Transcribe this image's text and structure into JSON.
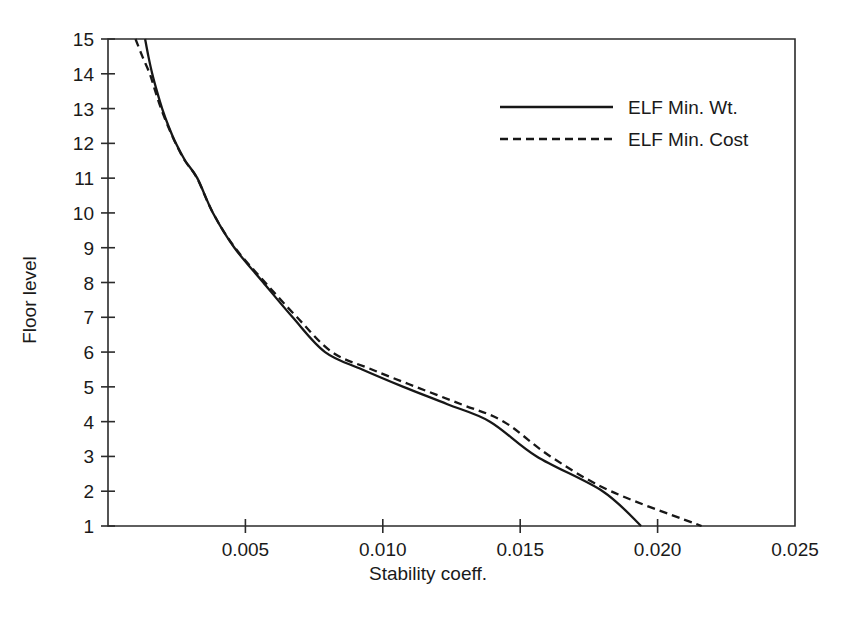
{
  "chart_data": {
    "type": "line",
    "title": "",
    "xlabel": "Stability coeff.",
    "ylabel": "Floor level",
    "xlim": [
      0.0,
      0.025
    ],
    "ylim": [
      1,
      15
    ],
    "grid": false,
    "legend_position": "top-right",
    "x_ticks": [
      0.0,
      0.005,
      0.01,
      0.015,
      0.02,
      0.025
    ],
    "x_tick_labels": [
      "",
      "0.005",
      "0.010",
      "0.015",
      "0.020",
      "0.025"
    ],
    "y_ticks": [
      1,
      2,
      3,
      4,
      5,
      6,
      7,
      8,
      9,
      10,
      11,
      12,
      13,
      14,
      15
    ],
    "y_tick_labels": [
      "1",
      "2",
      "3",
      "4",
      "5",
      "6",
      "7",
      "8",
      "9",
      "10",
      "11",
      "12",
      "13",
      "14",
      "15"
    ],
    "series": [
      {
        "name": "ELF Min. Wt.",
        "style": "solid",
        "color": "#171717",
        "x": [
          0.00135,
          0.00147,
          0.00161,
          0.00178,
          0.00197,
          0.0022,
          0.00247,
          0.00281,
          0.00325,
          0.00382,
          0.0046,
          0.00565,
          0.00672,
          0.0079,
          0.00925,
          0.01075,
          0.01235,
          0.0139,
          0.0156,
          0.018,
          0.0194
        ],
        "y": [
          15.0,
          14.5,
          14.0,
          13.5,
          13.0,
          12.5,
          12.0,
          11.5,
          11.0,
          10.0,
          9.0,
          8.0,
          7.0,
          6.0,
          5.5,
          5.0,
          4.5,
          4.0,
          3.0,
          2.0,
          1.0
        ]
      },
      {
        "name": "ELF Min. Cost",
        "style": "dashed",
        "color": "#171717",
        "x": [
          0.001,
          0.00125,
          0.00152,
          0.00172,
          0.00193,
          0.00218,
          0.00246,
          0.0028,
          0.00324,
          0.00382,
          0.00462,
          0.00572,
          0.00688,
          0.00815,
          0.0096,
          0.0112,
          0.01285,
          0.0144,
          0.0161,
          0.0183,
          0.0216
        ],
        "y": [
          15.0,
          14.5,
          14.0,
          13.5,
          13.0,
          12.5,
          12.0,
          11.5,
          11.0,
          10.0,
          9.0,
          8.0,
          7.0,
          6.0,
          5.5,
          5.0,
          4.5,
          4.0,
          3.0,
          2.0,
          1.0
        ]
      }
    ],
    "legend": [
      {
        "label": "ELF Min. Wt.",
        "style": "solid"
      },
      {
        "label": "ELF Min. Cost",
        "style": "dashed"
      }
    ]
  },
  "axes": {
    "y_title": "Floor level",
    "x_title": "Stability coeff."
  }
}
